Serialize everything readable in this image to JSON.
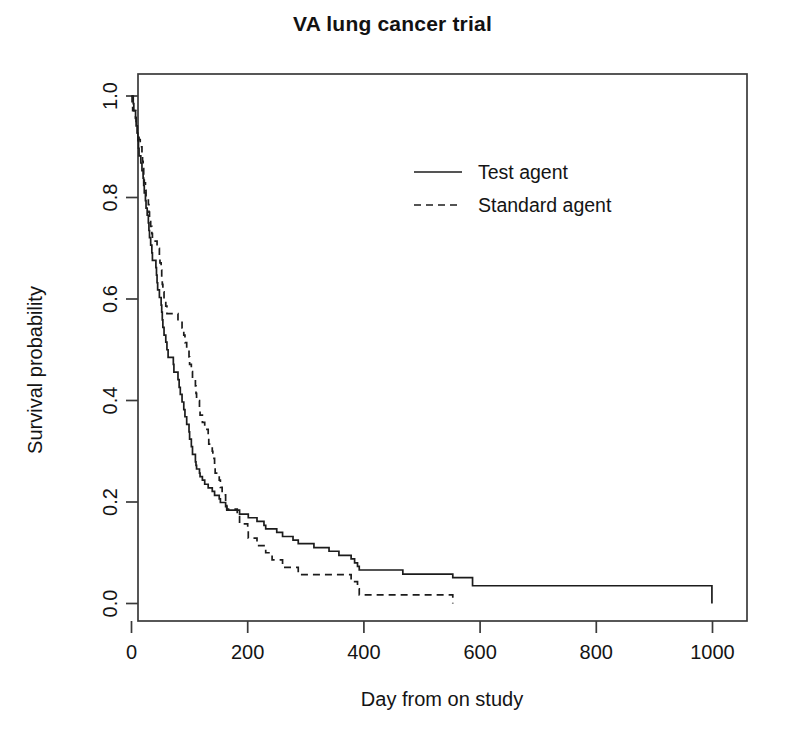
{
  "chart_data": {
    "type": "line",
    "title": "VA lung cancer trial",
    "xlabel": "Day from on study",
    "ylabel": "Survival probability",
    "xlim": [
      0,
      1030
    ],
    "ylim": [
      0,
      1.0
    ],
    "grid": false,
    "legend_position": "top-center-right",
    "xticks": [
      "0",
      "200",
      "400",
      "600",
      "800",
      "1000"
    ],
    "xtick_values": [
      0,
      200,
      400,
      600,
      800,
      1000
    ],
    "yticks": [
      "0.0",
      "0.2",
      "0.4",
      "0.6",
      "0.8",
      "1.0"
    ],
    "ytick_values": [
      0.0,
      0.2,
      0.4,
      0.6,
      0.8,
      1.0
    ],
    "series": [
      {
        "name": "Test agent",
        "style": "solid",
        "color": "#1c1c1c",
        "x": [
          0,
          3,
          4,
          7,
          8,
          10,
          11,
          12,
          13,
          16,
          18,
          20,
          21,
          22,
          24,
          25,
          27,
          29,
          30,
          31,
          33,
          35,
          36,
          42,
          43,
          44,
          45,
          48,
          51,
          52,
          53,
          54,
          56,
          59,
          61,
          63,
          72,
          73,
          80,
          82,
          84,
          87,
          90,
          92,
          95,
          99,
          100,
          103,
          105,
          110,
          111,
          112,
          117,
          118,
          122,
          126,
          132,
          133,
          139,
          140,
          143,
          144,
          151,
          153,
          156,
          162,
          164,
          177,
          182,
          186,
          200,
          201,
          216,
          228,
          231,
          242,
          250,
          260,
          278,
          283,
          287,
          314,
          340,
          357,
          378,
          384,
          389,
          392,
          411,
          467,
          553,
          587,
          991,
          999
        ],
        "y": [
          1.0,
          0.985,
          0.971,
          0.956,
          0.941,
          0.927,
          0.912,
          0.897,
          0.882,
          0.868,
          0.853,
          0.838,
          0.824,
          0.809,
          0.794,
          0.779,
          0.765,
          0.75,
          0.735,
          0.721,
          0.706,
          0.691,
          0.676,
          0.662,
          0.647,
          0.632,
          0.618,
          0.603,
          0.588,
          0.574,
          0.559,
          0.544,
          0.529,
          0.515,
          0.5,
          0.485,
          0.471,
          0.456,
          0.441,
          0.426,
          0.412,
          0.397,
          0.382,
          0.368,
          0.353,
          0.338,
          0.324,
          0.309,
          0.294,
          0.279,
          0.272,
          0.265,
          0.257,
          0.25,
          0.243,
          0.235,
          0.228,
          0.228,
          0.221,
          0.221,
          0.213,
          0.213,
          0.206,
          0.199,
          0.199,
          0.191,
          0.184,
          0.184,
          0.184,
          0.176,
          0.176,
          0.169,
          0.162,
          0.154,
          0.147,
          0.147,
          0.14,
          0.132,
          0.125,
          0.125,
          0.118,
          0.11,
          0.103,
          0.095,
          0.088,
          0.08,
          0.073,
          0.066,
          0.066,
          0.058,
          0.051,
          0.035,
          0.035,
          0.0
        ]
      },
      {
        "name": "Standard agent",
        "style": "dashed",
        "color": "#1c1c1c",
        "x": [
          0,
          1,
          2,
          7,
          8,
          10,
          13,
          15,
          18,
          19,
          20,
          21,
          22,
          24,
          25,
          29,
          30,
          31,
          33,
          35,
          36,
          44,
          45,
          48,
          49,
          51,
          52,
          53,
          54,
          56,
          59,
          61,
          80,
          84,
          87,
          90,
          92,
          95,
          99,
          100,
          103,
          105,
          110,
          111,
          112,
          117,
          118,
          122,
          126,
          132,
          133,
          139,
          140,
          143,
          144,
          151,
          153,
          156,
          162,
          164,
          177,
          182,
          186,
          200,
          201,
          216,
          228,
          231,
          242,
          250,
          260,
          278,
          283,
          287,
          314,
          340,
          357,
          378,
          384,
          389,
          392,
          411,
          553
        ],
        "y": [
          1.0,
          0.986,
          0.971,
          0.957,
          0.943,
          0.928,
          0.914,
          0.9,
          0.886,
          0.871,
          0.857,
          0.843,
          0.829,
          0.814,
          0.8,
          0.786,
          0.771,
          0.757,
          0.743,
          0.729,
          0.714,
          0.7,
          0.7,
          0.686,
          0.671,
          0.657,
          0.643,
          0.629,
          0.614,
          0.6,
          0.586,
          0.571,
          0.557,
          0.557,
          0.543,
          0.529,
          0.514,
          0.5,
          0.486,
          0.471,
          0.457,
          0.443,
          0.429,
          0.414,
          0.4,
          0.386,
          0.371,
          0.357,
          0.343,
          0.329,
          0.314,
          0.3,
          0.286,
          0.271,
          0.257,
          0.243,
          0.229,
          0.214,
          0.2,
          0.186,
          0.186,
          0.171,
          0.157,
          0.143,
          0.129,
          0.114,
          0.114,
          0.1,
          0.086,
          0.086,
          0.071,
          0.071,
          0.071,
          0.057,
          0.057,
          0.057,
          0.057,
          0.043,
          0.043,
          0.029,
          0.017,
          0.017,
          0.0
        ]
      }
    ],
    "legend": [
      {
        "label": "Test agent",
        "style": "solid"
      },
      {
        "label": "Standard agent",
        "style": "dashed"
      }
    ]
  }
}
